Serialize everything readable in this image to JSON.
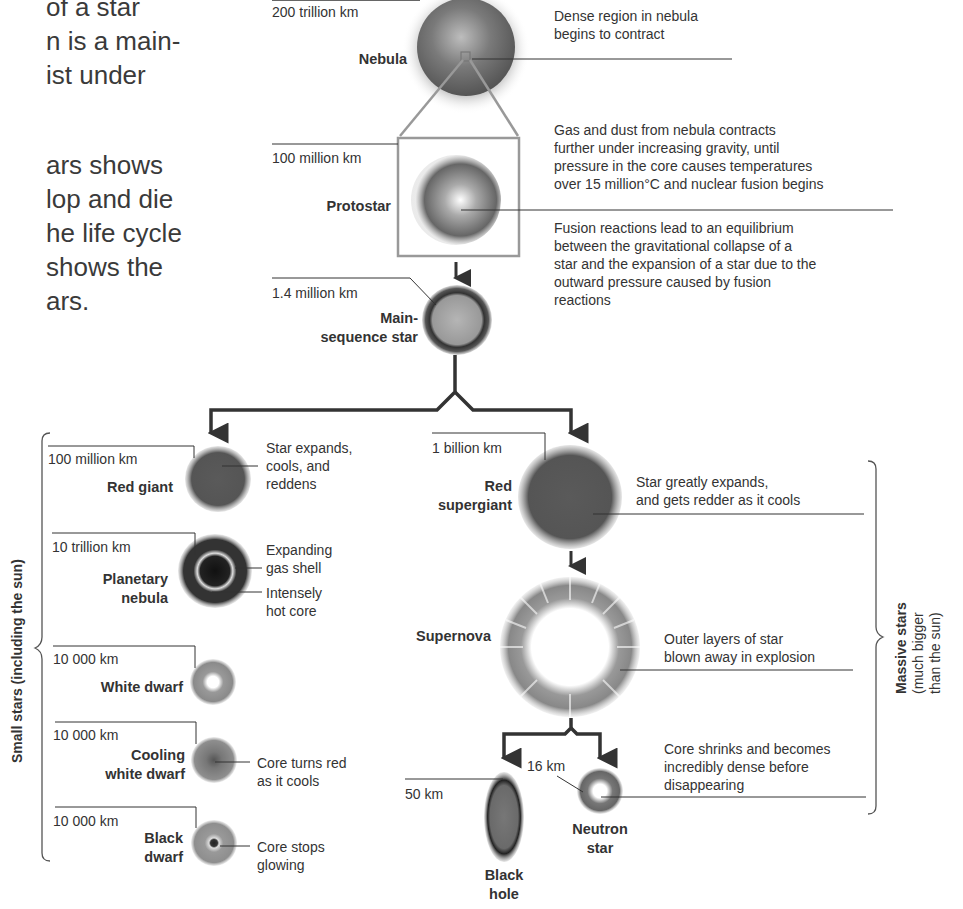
{
  "intro_text": {
    "lines": [
      "of a star",
      "n is a main-",
      "ist under",
      "",
      "ars shows",
      "lop and die",
      "he life cycle",
      "shows the",
      "ars."
    ]
  },
  "stages": {
    "nebula": {
      "name": "Nebula",
      "size": "200 trillion km",
      "description": [
        "Dense region in nebula",
        "begins to contract"
      ]
    },
    "protostar": {
      "name": "Protostar",
      "size": "100 million km",
      "description": [
        "Gas and dust from nebula contracts",
        "further under increasing gravity, until",
        "pressure in the core causes temperatures",
        "over 15 million°C and nuclear fusion begins"
      ]
    },
    "main_sequence": {
      "name_line1": "Main-",
      "name_line2": "sequence star",
      "size": "1.4 million km",
      "description": [
        "Fusion reactions lead to an equilibrium",
        "between the gravitational collapse of a",
        "star and the expansion of a star due to the",
        "outward pressure caused by fusion",
        "reactions"
      ]
    },
    "red_giant": {
      "name": "Red giant",
      "size": "100 million km",
      "description": [
        "Star expands,",
        "cools, and",
        "reddens"
      ]
    },
    "planetary_nebula": {
      "name_line1": "Planetary",
      "name_line2": "nebula",
      "size": "10 trillion km",
      "shell_label": [
        "Expanding",
        "gas shell"
      ],
      "core_label": [
        "Intensely",
        "hot core"
      ]
    },
    "white_dwarf": {
      "name": "White dwarf",
      "size": "10 000 km"
    },
    "cooling_white_dwarf": {
      "name_line1": "Cooling",
      "name_line2": "white dwarf",
      "size": "10 000 km",
      "description": [
        "Core turns red",
        "as it cools"
      ]
    },
    "black_dwarf": {
      "name_line1": "Black",
      "name_line2": "dwarf",
      "size": "10 000 km",
      "description": [
        "Core stops",
        "glowing"
      ]
    },
    "red_supergiant": {
      "name_line1": "Red",
      "name_line2": "supergiant",
      "size": "1 billion km",
      "description": [
        "Star greatly expands,",
        "and gets redder as it cools"
      ]
    },
    "supernova": {
      "name": "Supernova",
      "description": [
        "Outer layers of star",
        "blown away in explosion"
      ]
    },
    "black_hole": {
      "name_line1": "Black",
      "name_line2": "hole",
      "size": "50 km"
    },
    "neutron_star": {
      "name_line1": "Neutron",
      "name_line2": "star",
      "size": "16 km",
      "description": [
        "Core shrinks and becomes",
        "incredibly dense before",
        "disappearing"
      ]
    }
  },
  "groups": {
    "small": {
      "label": "Small stars (including the sun)"
    },
    "massive": {
      "label_bold": "Massive stars",
      "label_line2": "(much bigger",
      "label_line3": "than the sun)"
    }
  },
  "colors": {
    "text": "#333333",
    "line": "#333333",
    "box": "#999999",
    "star_dark": "#4a4a4a",
    "star_mid": "#888888"
  }
}
